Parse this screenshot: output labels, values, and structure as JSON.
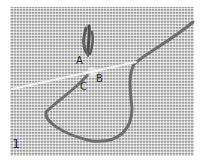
{
  "figure": {
    "number": "1",
    "labels": {
      "a": "A",
      "b": "B",
      "c": "C"
    }
  },
  "colors": {
    "canvas": "#b9b9b9",
    "yarn": "#6e6e6e",
    "needle": "#f4f4f4",
    "text": "#2a2a2a"
  }
}
